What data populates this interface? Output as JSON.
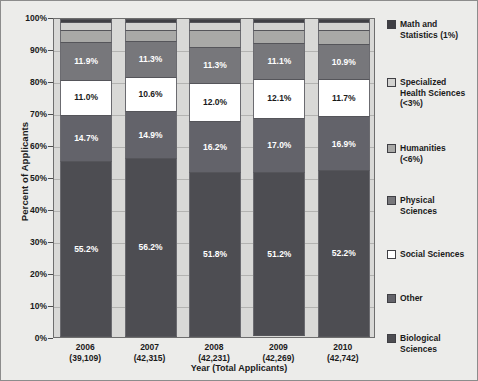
{
  "chart_data": {
    "type": "bar",
    "stacked": true,
    "normalized": true,
    "title": "",
    "xlabel": "Year (Total Applicants)",
    "ylabel": "Percent of Applicants",
    "ylim": [
      0,
      100
    ],
    "ytick_labels": [
      "100%",
      "90%",
      "80%",
      "70%",
      "60%",
      "50%",
      "40%",
      "30%",
      "20%",
      "10%",
      "0%"
    ],
    "ytick_values": [
      100,
      90,
      80,
      70,
      60,
      50,
      40,
      30,
      20,
      10,
      0
    ],
    "grid": true,
    "legend_position": "right",
    "categories": [
      "2006",
      "2007",
      "2008",
      "2009",
      "2010"
    ],
    "category_sublabels": [
      "(39,109)",
      "(42,315)",
      "(42,231)",
      "(42,269)",
      "(42,742)"
    ],
    "total_applicants": [
      39109,
      42315,
      42231,
      42269,
      42742
    ],
    "series": [
      {
        "name": "Math and Statistics (1%)",
        "short_name": "Math and Statistics",
        "color": "#3f3f44",
        "label_color": "#ffffff",
        "show_labels": false,
        "values": [
          1.0,
          1.0,
          1.0,
          1.0,
          1.0
        ],
        "value_labels": [
          "",
          "",
          "",
          "",
          ""
        ]
      },
      {
        "name": "Specialized Health Sciences (<3%)",
        "short_name": "Specialized Health Sciences",
        "color": "#d2d2d0",
        "label_color": "#1a1a1a",
        "show_labels": false,
        "values": [
          2.5,
          2.5,
          2.5,
          2.5,
          2.5
        ],
        "value_labels": [
          "",
          "",
          "",
          "",
          ""
        ]
      },
      {
        "name": "Humanities (<6%)",
        "short_name": "Humanities",
        "color": "#a9a9a7",
        "label_color": "#1a1a1a",
        "show_labels": false,
        "values": [
          3.7,
          3.5,
          5.2,
          4.1,
          4.4
        ],
        "value_labels": [
          "",
          "",
          "",
          "",
          ""
        ]
      },
      {
        "name": "Physical Sciences",
        "short_name": "Physical Sciences",
        "color": "#77777b",
        "label_color": "#ffffff",
        "show_labels": true,
        "values": [
          11.9,
          11.3,
          11.3,
          11.1,
          10.9
        ],
        "value_labels": [
          "11.9%",
          "11.3%",
          "11.3%",
          "11.1%",
          "10.9%"
        ]
      },
      {
        "name": "Social Sciences",
        "short_name": "Social Sciences",
        "color": "#ffffff",
        "label_color": "#1a1a1a",
        "show_labels": true,
        "values": [
          11.0,
          10.6,
          12.0,
          12.1,
          11.7
        ],
        "value_labels": [
          "11.0%",
          "10.6%",
          "12.0%",
          "12.1%",
          "11.7%"
        ]
      },
      {
        "name": "Other",
        "short_name": "Other",
        "color": "#63636a",
        "label_color": "#ffffff",
        "show_labels": true,
        "values": [
          14.7,
          14.9,
          16.2,
          17.0,
          16.9
        ],
        "value_labels": [
          "14.7%",
          "14.9%",
          "16.2%",
          "17.0%",
          "16.9%"
        ]
      },
      {
        "name": "Biological Sciences",
        "short_name": "Biological Sciences",
        "color": "#4d4d52",
        "label_color": "#ffffff",
        "show_labels": true,
        "values": [
          55.2,
          56.2,
          51.8,
          51.2,
          52.2
        ],
        "value_labels": [
          "55.2%",
          "56.2%",
          "51.8%",
          "51.2%",
          "52.2%"
        ]
      }
    ]
  },
  "legend": {
    "items": [
      {
        "label": "Math and\nStatistics (1%)",
        "color": "#3f3f44"
      },
      {
        "label": "Specialized\nHealth Sciences\n(<3%)",
        "color": "#d2d2d0"
      },
      {
        "label": "Humanities\n(<6%)",
        "color": "#a9a9a7"
      },
      {
        "label": "Physical\nSciences",
        "color": "#77777b"
      },
      {
        "label": "Social Sciences",
        "color": "#ffffff"
      },
      {
        "label": "Other",
        "color": "#63636a"
      },
      {
        "label": "Biological\nSciences",
        "color": "#4d4d52"
      }
    ]
  },
  "colors": {
    "figure_background": "#ececea",
    "plot_background": "#d9d9d7",
    "gridline": "#b3b3b1",
    "axis": "#4d4d4d",
    "text": "#1a1a1a"
  }
}
